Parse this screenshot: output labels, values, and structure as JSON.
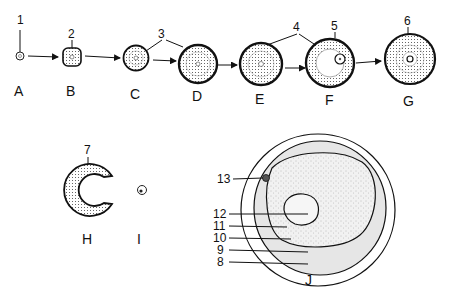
{
  "figure": {
    "type": "developmental-sequence-diagram",
    "stages": [
      {
        "id": "A",
        "label": "A",
        "callout": "1"
      },
      {
        "id": "B",
        "label": "B",
        "callout": "2"
      },
      {
        "id": "C",
        "label": "C"
      },
      {
        "id": "D",
        "label": "D"
      },
      {
        "id": "E",
        "label": "E"
      },
      {
        "id": "F",
        "label": "F",
        "callout": "5"
      },
      {
        "id": "G",
        "label": "G",
        "callout": "6"
      },
      {
        "id": "H",
        "label": "H",
        "callout": "7"
      },
      {
        "id": "I",
        "label": "I"
      },
      {
        "id": "J",
        "label": "J"
      }
    ],
    "shared_callouts": {
      "c3": "3",
      "c4": "4"
    },
    "section_J_callouts": [
      "13",
      "12",
      "11",
      "10",
      "9",
      "8"
    ],
    "colors": {
      "ink": "#111111",
      "background": "#ffffff",
      "shaded_band": "#e6e6e6",
      "stipple": "#9a9a9a"
    }
  }
}
